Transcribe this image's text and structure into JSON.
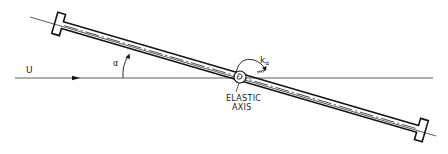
{
  "figure": {
    "type": "schematic",
    "colors": {
      "line": "#141414",
      "background": "#ffffff"
    }
  },
  "labels": {
    "freestream": "U",
    "angle": "α",
    "spring_symbol": "k",
    "spring_subscript": "α",
    "elastic_axis_line1": "ELASTIC",
    "elastic_axis_line2": "AXIS"
  },
  "geometry": {
    "freestream_line": {
      "x1": 15,
      "y1": 78,
      "x2": 433,
      "y2": 78
    },
    "chord_line": {
      "x1": 30,
      "y1": 17,
      "x2": 436,
      "y2": 136
    },
    "elastic_axis_center": {
      "x": 240,
      "y": 77
    },
    "pitch_angle_deg": 16
  }
}
